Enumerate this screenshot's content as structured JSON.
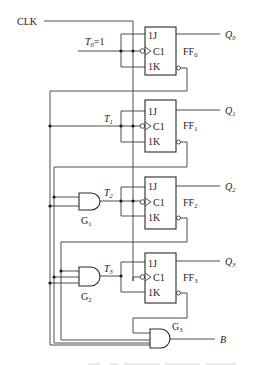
{
  "diagram": {
    "type": "synchronous 4-bit binary counter (JK flip-flops in T mode)",
    "clock_label": "CLK",
    "t0_label": "T",
    "t0_sub": "0",
    "t0_value": "=1",
    "flip_flops": [
      {
        "name": "FF",
        "sub": "0",
        "t_label": "T",
        "t_sub": "0",
        "q_label": "Q",
        "q_sub": "0",
        "pins": [
          "1J",
          "C1",
          "1K"
        ]
      },
      {
        "name": "FF",
        "sub": "1",
        "t_label": "T",
        "t_sub": "1",
        "q_label": "Q",
        "q_sub": "1",
        "pins": [
          "1J",
          "C1",
          "1K"
        ]
      },
      {
        "name": "FF",
        "sub": "2",
        "t_label": "T",
        "t_sub": "2",
        "q_label": "Q",
        "q_sub": "2",
        "pins": [
          "1J",
          "C1",
          "1K"
        ]
      },
      {
        "name": "FF",
        "sub": "3",
        "t_label": "T",
        "t_sub": "3",
        "q_label": "Q",
        "q_sub": "3",
        "pins": [
          "1J",
          "C1",
          "1K"
        ]
      }
    ],
    "gates": [
      {
        "name": "G",
        "sub": "1",
        "type": "AND"
      },
      {
        "name": "G",
        "sub": "2",
        "type": "AND"
      },
      {
        "name": "G",
        "sub": "3",
        "type": "AND"
      }
    ],
    "output_label": "B"
  }
}
